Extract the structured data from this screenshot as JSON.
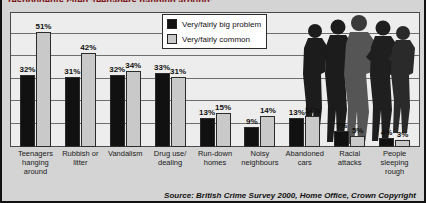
{
  "headline": "respondents cited 'teenagers hanging around'",
  "source": "Source: British Crime Survey 2000, Home Office, Crown Copyright",
  "legend": {
    "items": [
      {
        "label": "Very/fairly big problem",
        "color": "#111111",
        "swatch": "dark"
      },
      {
        "label": "Very/fairly common",
        "color": "#c9c9c9",
        "swatch": "light"
      }
    ]
  },
  "colors": {
    "big_problem": "#111111",
    "common": "#c9c9c9",
    "plot_background": "#ededed",
    "card_background": "#d4d4d4",
    "gridline": "#6e6e6e",
    "headline_text": "#7d1416"
  },
  "chart_data": {
    "type": "bar",
    "title": "respondents cited 'teenagers hanging around'",
    "xlabel": "",
    "ylabel": "",
    "ylim": [
      0,
      60
    ],
    "grid": true,
    "gridlines": [
      10,
      20,
      30,
      40,
      50,
      60
    ],
    "legend_position": "top-right",
    "value_suffix": "%",
    "categories": [
      "Teenagers hanging around",
      "Rubbish or litter",
      "Vandalism",
      "Drug use/ dealing",
      "Run-down homes",
      "Noisy neighbours",
      "Abandoned cars",
      "Racial attacks",
      "People sleeping rough"
    ],
    "series": [
      {
        "name": "Very/fairly big problem",
        "color": "#111111",
        "values": [
          32,
          31,
          32,
          33,
          13,
          9,
          13,
          7,
          4
        ],
        "labels": [
          "32%",
          "31%",
          "32%",
          "33%",
          "13%",
          "9%",
          "13%",
          "7%",
          "4%"
        ]
      },
      {
        "name": "Very/fairly common",
        "color": "#c9c9c9",
        "values": [
          51,
          42,
          34,
          31,
          15,
          14,
          14,
          5,
          3
        ],
        "labels": [
          "51%",
          "42%",
          "34%",
          "31%",
          "15%",
          "14%",
          "14%",
          "5%",
          "3%"
        ]
      }
    ],
    "annotations": [
      "Source: British Crime Survey 2000, Home Office, Crown Copyright"
    ]
  }
}
